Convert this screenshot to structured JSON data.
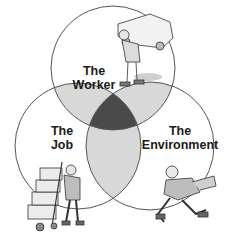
{
  "diagram": {
    "type": "venn",
    "circles": [
      {
        "id": "worker",
        "line1": "The",
        "line2": "Worker"
      },
      {
        "id": "job",
        "line1": "The",
        "line2": "Job"
      },
      {
        "id": "environment",
        "line1": "The",
        "line2": "Environment"
      }
    ],
    "colors": {
      "outline": "#555555",
      "pair_overlap": "#d8d8d8",
      "center_overlap": "#4a4a4a",
      "background": "#ffffff"
    },
    "illustrations": [
      {
        "circle": "worker",
        "depicts": "worker carrying a car on his back"
      },
      {
        "circle": "job",
        "depicts": "worker pushing a hand truck stacked with boxes"
      },
      {
        "circle": "environment",
        "depicts": "worker running/tripping"
      }
    ]
  }
}
